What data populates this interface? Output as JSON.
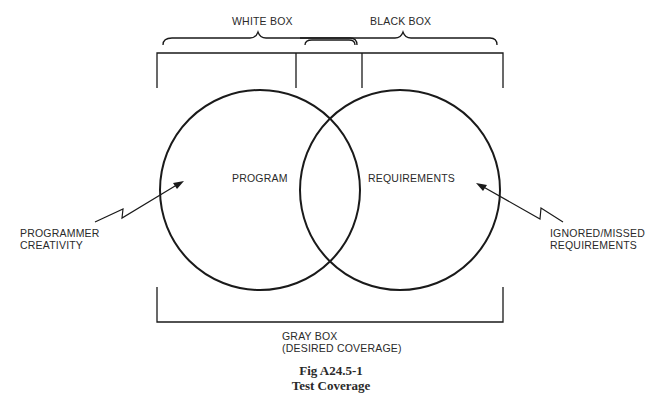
{
  "diagram": {
    "top_labels": {
      "white_box": "WHITE BOX",
      "black_box": "BLACK BOX"
    },
    "circles": {
      "left": "PROGRAM",
      "right": "REQUIREMENTS"
    },
    "arrows": {
      "left": {
        "line1": "PROGRAMMER",
        "line2": "CREATIVITY"
      },
      "right": {
        "line1": "IGNORED/MISSED",
        "line2": "REQUIREMENTS"
      }
    },
    "bottom_label": {
      "line1": "GRAY BOX",
      "line2": "(DESIRED COVERAGE)"
    },
    "caption": {
      "figure": "Fig A24.5-1",
      "title": "Test Coverage"
    },
    "colors": {
      "stroke": "#1a1a1a",
      "background": "#ffffff"
    }
  }
}
